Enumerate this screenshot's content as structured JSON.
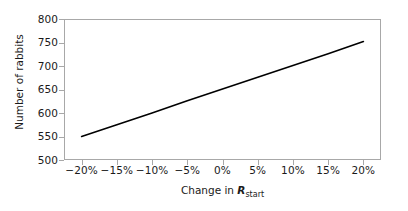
{
  "figure": {
    "width": 408,
    "height": 211,
    "background": "#ffffff"
  },
  "chart_data": {
    "type": "line",
    "title": "",
    "xlabel_prefix": "Change in ",
    "xlabel_symbol": "R",
    "xlabel_subscript": "start",
    "xlabel": "Change in R_start",
    "ylabel": "Number of rabbits",
    "xlim": [
      -22.5,
      22.5
    ],
    "ylim": [
      500,
      800
    ],
    "xticks": [
      -20,
      -15,
      -10,
      -5,
      0,
      5,
      10,
      15,
      20
    ],
    "xtick_labels": [
      "−20%",
      "−15%",
      "−10%",
      "−5%",
      "0%",
      "5%",
      "10%",
      "15%",
      "20%"
    ],
    "yticks": [
      500,
      550,
      600,
      650,
      700,
      750,
      800
    ],
    "ytick_labels": [
      "500",
      "550",
      "600",
      "650",
      "700",
      "750",
      "800"
    ],
    "grid": false,
    "legend": false,
    "series": [
      {
        "name": "Number of rabbits",
        "color": "#000000",
        "line_width": 1.6,
        "x": [
          -20,
          -15,
          -10,
          -5,
          0,
          5,
          10,
          15,
          20
        ],
        "values": [
          550,
          575,
          600,
          626,
          651,
          676,
          701,
          726,
          752
        ]
      }
    ]
  },
  "style": {
    "frame_color": "#a8a8a8",
    "tick_color": "#a8a8a8",
    "text_color": "#1a1a1a",
    "line_color": "#000000"
  }
}
